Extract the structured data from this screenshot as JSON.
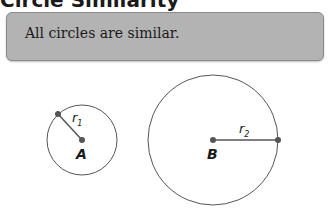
{
  "title": "Circle Similarity",
  "callout": {
    "text": "All circles are similar."
  },
  "diagram": {
    "circles": [
      {
        "center_label": "A",
        "radius_label": "r",
        "radius_subscript": "1"
      },
      {
        "center_label": "B",
        "radius_label": "r",
        "radius_subscript": "2"
      }
    ],
    "colors": {
      "stroke": "#555555",
      "point": "#555555",
      "label": "#1a1a1a"
    }
  }
}
